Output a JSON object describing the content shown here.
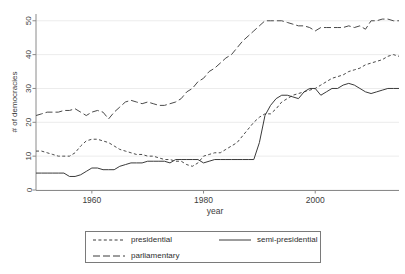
{
  "chart_data": {
    "type": "line",
    "title": "",
    "xlabel": "year",
    "ylabel": "# of democracies",
    "xlim": [
      1950,
      2015
    ],
    "ylim": [
      0,
      52
    ],
    "grid": true,
    "legend_position": "below-axis",
    "xticks": [
      1960,
      1980,
      2000
    ],
    "xtick_labels": [
      "1960",
      "1980",
      "2000"
    ],
    "yticks": [
      0,
      10,
      20,
      30,
      40,
      50
    ],
    "ytick_labels": [
      "0",
      "10",
      "20",
      "30",
      "40",
      "50"
    ],
    "x": [
      1950,
      1951,
      1952,
      1953,
      1954,
      1955,
      1956,
      1957,
      1958,
      1959,
      1960,
      1961,
      1962,
      1963,
      1964,
      1965,
      1966,
      1967,
      1968,
      1969,
      1970,
      1971,
      1972,
      1973,
      1974,
      1975,
      1976,
      1977,
      1978,
      1979,
      1980,
      1981,
      1982,
      1983,
      1984,
      1985,
      1986,
      1987,
      1988,
      1989,
      1990,
      1991,
      1992,
      1993,
      1994,
      1995,
      1996,
      1997,
      1998,
      1999,
      2000,
      2001,
      2002,
      2003,
      2004,
      2005,
      2006,
      2007,
      2008,
      2009,
      2010,
      2011,
      2012,
      2013,
      2014,
      2015
    ],
    "series": [
      {
        "name": "presidential",
        "style": "short-dash",
        "color": "#4a4a4a",
        "values": [
          11.5,
          11.5,
          11,
          10.5,
          10,
          10,
          10,
          11,
          13,
          14.5,
          15,
          15,
          14.5,
          14,
          13,
          12,
          11.5,
          11,
          10.5,
          10.5,
          10,
          10,
          9.5,
          9,
          9,
          8.5,
          8.5,
          7.5,
          7,
          8,
          10,
          10.5,
          11,
          11,
          12,
          13,
          14,
          16,
          18,
          20,
          21.5,
          22.5,
          22.5,
          24,
          26,
          27,
          28,
          28.5,
          29,
          29.5,
          30,
          31,
          32,
          33,
          33.5,
          34,
          35,
          35.5,
          36,
          37,
          37.5,
          38,
          38.5,
          39.5,
          40,
          39.5
        ]
      },
      {
        "name": "parliamentary",
        "style": "long-dash",
        "color": "#4a4a4a",
        "values": [
          22,
          22.5,
          23,
          23,
          23,
          23.5,
          23.5,
          24,
          23,
          22,
          23,
          23.5,
          23,
          21,
          23,
          24.5,
          26,
          26.5,
          26,
          25.5,
          26,
          25.5,
          25,
          25,
          25.5,
          26,
          27,
          29,
          30,
          32,
          33,
          35,
          36,
          37.5,
          39,
          40,
          42,
          44,
          45.5,
          47,
          48.5,
          50,
          50,
          50,
          50,
          49.5,
          49,
          48.5,
          48.5,
          48,
          47,
          48,
          48,
          48,
          48,
          48,
          48.5,
          48,
          48.5,
          47.5,
          50,
          50,
          50.5,
          50.5,
          50,
          50
        ]
      },
      {
        "name": "semi-presidential",
        "style": "solid",
        "color": "#3a3a3a",
        "values": [
          5,
          5,
          5,
          5,
          5,
          5,
          4,
          4,
          4.5,
          5.5,
          6.5,
          6.5,
          6,
          6,
          6,
          7,
          7.5,
          8,
          8,
          8,
          8.5,
          8.5,
          8.5,
          8.5,
          8,
          9,
          9,
          9,
          9,
          9,
          8,
          8.5,
          9,
          9,
          9,
          9,
          9,
          9,
          9,
          9,
          14,
          22,
          25,
          27,
          28,
          28,
          27.5,
          27,
          29,
          30,
          30,
          28,
          29,
          30,
          30,
          31,
          31.5,
          31,
          30,
          29,
          28.5,
          29,
          29.5,
          30,
          30,
          30
        ]
      }
    ]
  },
  "legend": {
    "entries": [
      {
        "label": "presidential",
        "style": "short-dash"
      },
      {
        "label": "semi-presidential",
        "style": "solid"
      },
      {
        "label": "parliamentary",
        "style": "long-dash"
      }
    ]
  }
}
